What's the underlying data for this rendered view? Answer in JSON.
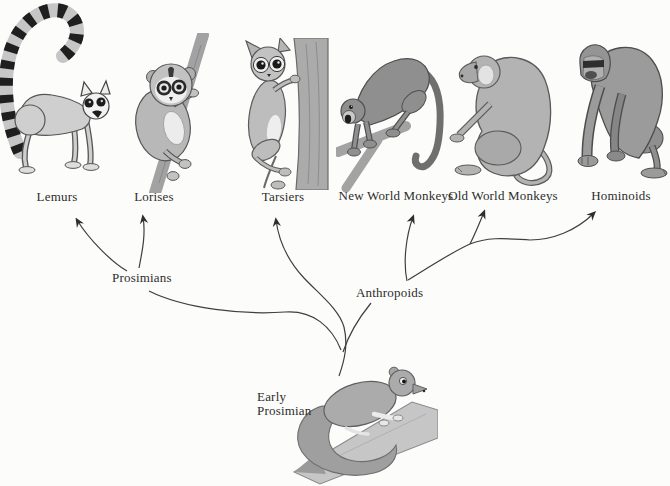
{
  "diagram": {
    "type": "phylogenetic-tree",
    "colors": {
      "background": "#fcfcfa",
      "line": "#3f3f3f",
      "text": "#2d2d2d"
    },
    "taxa": [
      {
        "label": "Lemurs"
      },
      {
        "label": "Lorises"
      },
      {
        "label": "Tarsiers"
      },
      {
        "label": "New World Monkeys"
      },
      {
        "label": "Old World Monkeys"
      },
      {
        "label": "Hominoids"
      }
    ],
    "clades": {
      "prosimians": "Prosimians",
      "anthropoids": "Anthropoids"
    },
    "root": {
      "line1": "Early",
      "line2": "Prosimian"
    },
    "edges": [
      "Early Prosimian -> Prosimians",
      "Early Prosimian -> Tarsiers",
      "Early Prosimian -> Anthropoids",
      "Prosimians -> Lemurs",
      "Prosimians -> Lorises",
      "Anthropoids -> New World Monkeys",
      "Anthropoids -> Old World Monkeys",
      "Anthropoids -> Hominoids"
    ],
    "illustrations": [
      "ring-tailed-lemur",
      "loris-on-branch",
      "tarsier-on-trunk",
      "new-world-monkey-on-branch",
      "baboon-sitting",
      "gorilla-knuckle-walking",
      "early-prosimian-on-branch"
    ]
  }
}
